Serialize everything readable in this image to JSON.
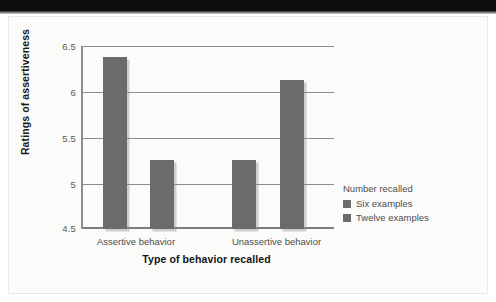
{
  "chart_data": {
    "type": "bar",
    "title": "",
    "xlabel": "Type of behavior recalled",
    "ylabel": "Ratings of assertiveness",
    "categories": [
      "Assertive behavior",
      "Unassertive behavior"
    ],
    "series": [
      {
        "name": "Six examples",
        "values": [
          6.38,
          5.25
        ]
      },
      {
        "name": "Twelve examples",
        "values": [
          5.25,
          6.13
        ]
      }
    ],
    "ylim": [
      4.5,
      6.5
    ],
    "yticks": [
      "4.5",
      "5",
      "5.5",
      "6",
      "6.5"
    ],
    "ytick_values": [
      4.5,
      5,
      5.5,
      6,
      6.5
    ],
    "grid": true,
    "legend_position": "right",
    "legend_title": "Number recalled",
    "bar_color": "#6b6b6b",
    "gridline_color": "#8c8c8c",
    "axis_color": "#7d7d7d"
  },
  "legend": {
    "title": "Number recalled",
    "entries": [
      {
        "label": "Six examples",
        "color": "#6b6b6b"
      },
      {
        "label": "Twelve examples",
        "color": "#6b6b6b"
      }
    ]
  },
  "axes": {
    "y_title": "Ratings of assertiveness",
    "x_title": "Type of behavior recalled",
    "y_ticks": [
      "6.5",
      "6",
      "5.5",
      "5",
      "4.5"
    ],
    "x_ticks": [
      "Assertive behavior",
      "Unassertive behavior"
    ]
  },
  "page": {
    "background": "#fbfbf9",
    "band_color": "#0d0d0d"
  }
}
